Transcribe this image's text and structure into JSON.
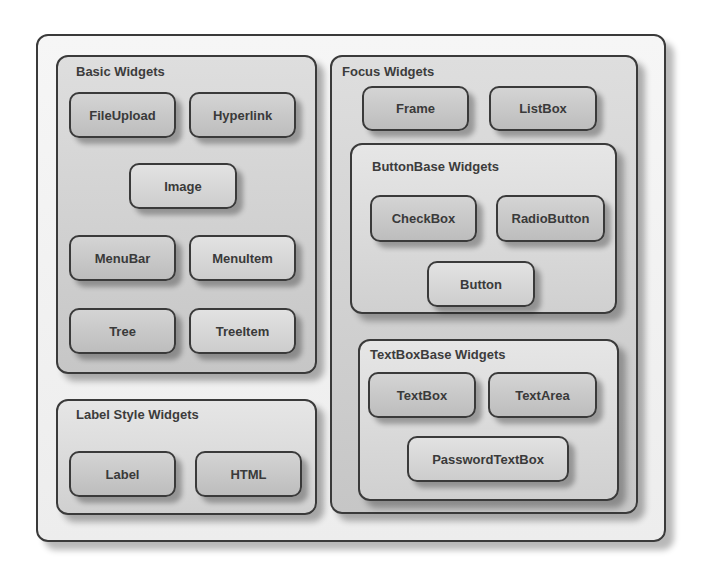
{
  "diagram": {
    "groups": {
      "basic": {
        "title": "Basic Widgets",
        "widgets": [
          "FileUpload",
          "Hyperlink",
          "Image",
          "MenuBar",
          "MenuItem",
          "Tree",
          "TreeItem"
        ]
      },
      "label_style": {
        "title": "Label Style Widgets",
        "widgets": [
          "Label",
          "HTML"
        ]
      },
      "focus": {
        "title": "Focus Widgets",
        "widgets": [
          "Frame",
          "ListBox"
        ]
      },
      "button_base": {
        "title": "ButtonBase Widgets",
        "widgets": [
          "CheckBox",
          "RadioButton",
          "Button"
        ]
      },
      "textbox_base": {
        "title": "TextBoxBase Widgets",
        "widgets": [
          "TextBox",
          "TextArea",
          "PasswordTextBox"
        ]
      }
    }
  }
}
